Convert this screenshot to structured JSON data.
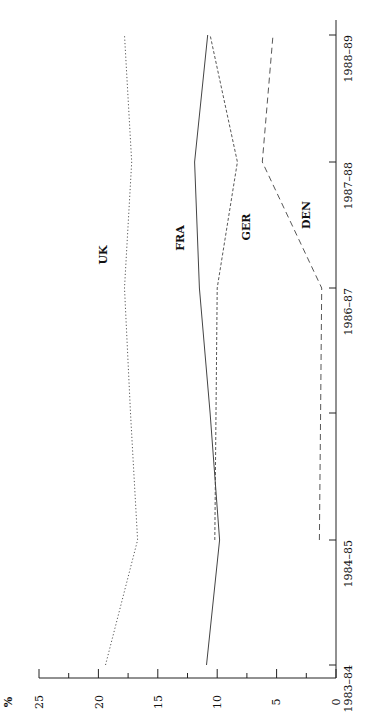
{
  "chart_data": {
    "type": "line",
    "orientation": "rotated-90-ccw",
    "title": "",
    "xlabel": "",
    "ylabel": "%",
    "ylim": [
      0,
      25
    ],
    "yticks": [
      0,
      5,
      10,
      15,
      20,
      25
    ],
    "x": [
      "1983-84",
      "1984-85",
      "1985-86",
      "1986-87",
      "1987-88",
      "1988-89"
    ],
    "x_tick_labels": [
      "1983–84",
      "1984–85",
      "",
      "1986–87",
      "1987–88",
      "1988–89"
    ],
    "grid": false,
    "legend": "inline labels",
    "series": [
      {
        "name": "UK",
        "style": "dotted",
        "values": [
          19.4,
          16.7,
          17.3,
          17.8,
          17.2,
          17.8
        ]
      },
      {
        "name": "FRA",
        "style": "solid",
        "values": [
          10.9,
          9.8,
          10.6,
          11.5,
          11.9,
          10.8
        ]
      },
      {
        "name": "GER",
        "style": "short-dashed",
        "values": [
          null,
          10.2,
          10.1,
          10.0,
          8.3,
          10.6
        ]
      },
      {
        "name": "DEN",
        "style": "long-dashed",
        "values": [
          null,
          1.4,
          1.3,
          1.2,
          6.2,
          5.3
        ]
      }
    ]
  },
  "labels": {
    "y_unit": "%",
    "uk": "UK",
    "fra": "FRA",
    "ger": "GER",
    "den": "DEN",
    "y0": "0",
    "y5": "5",
    "y10": "10",
    "y15": "15",
    "y20": "20",
    "y25": "25",
    "x0": "1983–84",
    "x1": "1984–85",
    "x3": "1986–87",
    "x4": "1987–88",
    "x5": "1988–89"
  }
}
